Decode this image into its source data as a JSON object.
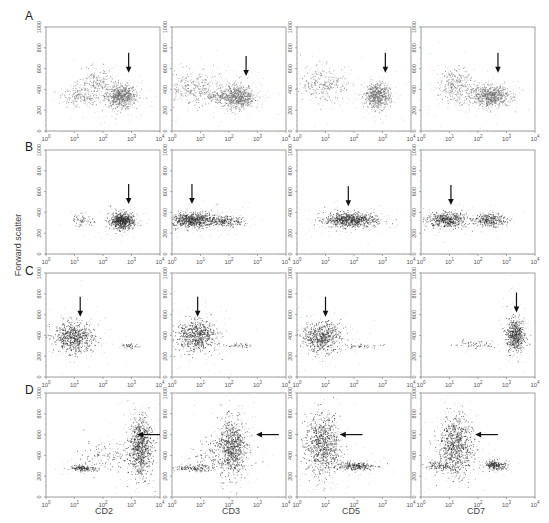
{
  "figure": {
    "y_axis_label": "Forward scatter",
    "row_labels": [
      "A",
      "B",
      "C",
      "D"
    ],
    "x_axis_labels": [
      "CD2",
      "CD3",
      "CD5",
      "CD7"
    ],
    "y_ticks": [
      "0",
      "200",
      "400",
      "600",
      "800",
      "1000"
    ],
    "x_ticks": [
      "10^0",
      "10^1",
      "10^2",
      "10^3",
      "10^4"
    ],
    "colors": {
      "frame": "#888888",
      "dot_gray": "#6a6a6a",
      "dot_dark": "#2b2b2b",
      "arrow": "#111111"
    }
  },
  "chart_data": {
    "type": "scatter",
    "title": "",
    "xlabel": "CD2 / CD3 / CD5 / CD7 (log fluorescence)",
    "ylabel": "Forward scatter",
    "xscale": "log",
    "xlim": [
      1,
      10000
    ],
    "ylim": [
      0,
      1000
    ],
    "grid": false,
    "legend": "none",
    "rows": [
      "A",
      "B",
      "C",
      "D"
    ],
    "columns": [
      "CD2",
      "CD3",
      "CD5",
      "CD7"
    ],
    "panels": [
      {
        "row": "A",
        "col": "CD2",
        "tone": "gray",
        "arrow": {
          "dir": "down",
          "logx": 2.9,
          "y": 560
        },
        "clusters": [
          {
            "logx": 2.6,
            "y": 340,
            "sx": 0.28,
            "sy": 55,
            "n": 700
          },
          {
            "logx": 1.75,
            "y": 470,
            "sx": 0.3,
            "sy": 60,
            "n": 160
          },
          {
            "logx": 1.2,
            "y": 330,
            "sx": 0.3,
            "sy": 40,
            "n": 160
          }
        ]
      },
      {
        "row": "A",
        "col": "CD3",
        "tone": "gray",
        "arrow": {
          "dir": "down",
          "logx": 2.6,
          "y": 530
        },
        "clusters": [
          {
            "logx": 2.3,
            "y": 330,
            "sx": 0.28,
            "sy": 55,
            "n": 650
          },
          {
            "logx": 0.7,
            "y": 420,
            "sx": 0.5,
            "sy": 80,
            "n": 300
          },
          {
            "logx": 1.6,
            "y": 330,
            "sx": 0.25,
            "sy": 30,
            "n": 120
          }
        ]
      },
      {
        "row": "A",
        "col": "CD5",
        "tone": "gray",
        "arrow": {
          "dir": "down",
          "logx": 3.1,
          "y": 560
        },
        "clusters": [
          {
            "logx": 2.8,
            "y": 340,
            "sx": 0.22,
            "sy": 60,
            "n": 600
          },
          {
            "logx": 0.9,
            "y": 450,
            "sx": 0.4,
            "sy": 80,
            "n": 260
          }
        ]
      },
      {
        "row": "A",
        "col": "CD7",
        "tone": "gray",
        "arrow": {
          "dir": "down",
          "logx": 2.7,
          "y": 560
        },
        "clusters": [
          {
            "logx": 2.4,
            "y": 340,
            "sx": 0.35,
            "sy": 50,
            "n": 700
          },
          {
            "logx": 1.2,
            "y": 440,
            "sx": 0.3,
            "sy": 80,
            "n": 280
          }
        ]
      },
      {
        "row": "B",
        "col": "CD2",
        "tone": "dark",
        "arrow": {
          "dir": "down",
          "logx": 2.9,
          "y": 480
        },
        "clusters": [
          {
            "logx": 2.65,
            "y": 320,
            "sx": 0.2,
            "sy": 40,
            "n": 650
          },
          {
            "logx": 1.25,
            "y": 330,
            "sx": 0.2,
            "sy": 30,
            "n": 60
          }
        ]
      },
      {
        "row": "B",
        "col": "CD3",
        "tone": "dark",
        "arrow": {
          "dir": "down",
          "logx": 0.7,
          "y": 480
        },
        "clusters": [
          {
            "logx": 0.7,
            "y": 330,
            "sx": 0.45,
            "sy": 35,
            "n": 750
          },
          {
            "logx": 1.9,
            "y": 320,
            "sx": 0.3,
            "sy": 25,
            "n": 200
          }
        ]
      },
      {
        "row": "B",
        "col": "CD5",
        "tone": "dark",
        "arrow": {
          "dir": "down",
          "logx": 1.8,
          "y": 460
        },
        "clusters": [
          {
            "logx": 1.85,
            "y": 330,
            "sx": 0.45,
            "sy": 35,
            "n": 750
          }
        ]
      },
      {
        "row": "B",
        "col": "CD7",
        "tone": "dark",
        "arrow": {
          "dir": "down",
          "logx": 1.05,
          "y": 470
        },
        "clusters": [
          {
            "logx": 0.9,
            "y": 330,
            "sx": 0.35,
            "sy": 35,
            "n": 500
          },
          {
            "logx": 2.4,
            "y": 330,
            "sx": 0.28,
            "sy": 30,
            "n": 300
          }
        ]
      },
      {
        "row": "C",
        "col": "CD2",
        "tone": "dark",
        "arrow": {
          "dir": "down",
          "logx": 1.2,
          "y": 580
        },
        "clusters": [
          {
            "logx": 0.95,
            "y": 380,
            "sx": 0.35,
            "sy": 70,
            "n": 650
          },
          {
            "logx": 2.95,
            "y": 300,
            "sx": 0.15,
            "sy": 12,
            "n": 40
          }
        ]
      },
      {
        "row": "C",
        "col": "CD3",
        "tone": "dark",
        "arrow": {
          "dir": "down",
          "logx": 0.9,
          "y": 580
        },
        "clusters": [
          {
            "logx": 0.85,
            "y": 400,
            "sx": 0.35,
            "sy": 75,
            "n": 650
          },
          {
            "logx": 2.35,
            "y": 305,
            "sx": 0.2,
            "sy": 10,
            "n": 40
          }
        ]
      },
      {
        "row": "C",
        "col": "CD5",
        "tone": "dark",
        "arrow": {
          "dir": "down",
          "logx": 1.0,
          "y": 580
        },
        "clusters": [
          {
            "logx": 0.85,
            "y": 390,
            "sx": 0.35,
            "sy": 70,
            "n": 600
          },
          {
            "logx": 2.3,
            "y": 300,
            "sx": 0.4,
            "sy": 8,
            "n": 40
          }
        ]
      },
      {
        "row": "C",
        "col": "CD7",
        "tone": "dark",
        "arrow": {
          "dir": "down",
          "logx": 3.35,
          "y": 620
        },
        "clusters": [
          {
            "logx": 3.3,
            "y": 400,
            "sx": 0.15,
            "sy": 80,
            "n": 550
          },
          {
            "logx": 1.8,
            "y": 320,
            "sx": 0.5,
            "sy": 20,
            "n": 60
          }
        ]
      },
      {
        "row": "D",
        "col": "CD2",
        "tone": "dark",
        "arrow": {
          "dir": "left",
          "logx": 3.2,
          "y": 600,
          "len": 0.8
        },
        "clusters": [
          {
            "logx": 3.3,
            "y": 480,
            "sx": 0.2,
            "sy": 140,
            "n": 800
          },
          {
            "logx": 1.3,
            "y": 280,
            "sx": 0.25,
            "sy": 15,
            "n": 160
          },
          {
            "logx": 2.1,
            "y": 400,
            "sx": 0.4,
            "sy": 70,
            "n": 120
          }
        ]
      },
      {
        "row": "D",
        "col": "CD3",
        "tone": "dark",
        "arrow": {
          "dir": "left",
          "logx": 2.95,
          "y": 600,
          "len": 0.8
        },
        "clusters": [
          {
            "logx": 2.1,
            "y": 470,
            "sx": 0.25,
            "sy": 140,
            "n": 800
          },
          {
            "logx": 0.8,
            "y": 280,
            "sx": 0.35,
            "sy": 15,
            "n": 150
          },
          {
            "logx": 1.4,
            "y": 420,
            "sx": 0.3,
            "sy": 70,
            "n": 80
          }
        ]
      },
      {
        "row": "D",
        "col": "CD5",
        "tone": "dark",
        "arrow": {
          "dir": "left",
          "logx": 1.5,
          "y": 600,
          "len": 0.8
        },
        "clusters": [
          {
            "logx": 0.9,
            "y": 500,
            "sx": 0.3,
            "sy": 140,
            "n": 800
          },
          {
            "logx": 2.0,
            "y": 300,
            "sx": 0.35,
            "sy": 20,
            "n": 250
          }
        ]
      },
      {
        "row": "D",
        "col": "CD7",
        "tone": "dark",
        "arrow": {
          "dir": "left",
          "logx": 1.9,
          "y": 600,
          "len": 0.8
        },
        "clusters": [
          {
            "logx": 1.2,
            "y": 490,
            "sx": 0.3,
            "sy": 140,
            "n": 800
          },
          {
            "logx": 2.6,
            "y": 310,
            "sx": 0.2,
            "sy": 20,
            "n": 220
          },
          {
            "logx": 0.6,
            "y": 300,
            "sx": 0.3,
            "sy": 20,
            "n": 120
          }
        ]
      }
    ]
  }
}
